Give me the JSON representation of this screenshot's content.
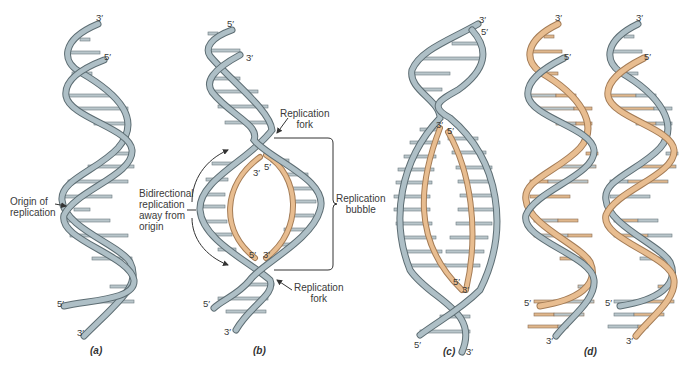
{
  "figure": {
    "colors": {
      "parent_strand_fill": "#aebfc6",
      "parent_strand_edge": "#5d6d73",
      "new_strand_fill": "#e8bd90",
      "new_strand_edge": "#a47c56",
      "base_pair": "#b7c3c8",
      "text": "#3a3a3a"
    },
    "panels": [
      {
        "id": "a",
        "label": "(a)",
        "ends": {
          "top_left": "3′",
          "top_right": "5′",
          "bottom_left": "5′",
          "bottom_right": "3′"
        },
        "annotations": {
          "origin": "Origin of\nreplication"
        }
      },
      {
        "id": "b",
        "label": "(b)",
        "ends": {
          "top_left": "5′",
          "top_right": "3′",
          "bottom_left": "5′",
          "bottom_right": "3′",
          "bubble_top_left": "3′",
          "bubble_top_right": "5′",
          "bubble_bottom_left": "5′",
          "bubble_bottom_right": "3′"
        },
        "annotations": {
          "fork_top": "Replication\nfork",
          "fork_bottom": "Replication\nfork",
          "bidirectional": "Bidirectional\nreplication\naway from\norigin",
          "bubble": "Replication\nbubble"
        }
      },
      {
        "id": "c",
        "label": "(c)",
        "ends": {
          "top_left": "3′",
          "top_right": "5′",
          "bottom_left": "5′",
          "bottom_right": "3′",
          "bubble_top_left": "3′",
          "bubble_top_right": "5′",
          "bubble_bottom_left": "5′",
          "bubble_bottom_right": "3′"
        }
      },
      {
        "id": "d",
        "label": "(d)",
        "ends": {
          "left_top": "3′",
          "left_mid": "5′",
          "left_bottom_5": "5′",
          "left_bottom_3": "3′",
          "right_top": "3′",
          "right_mid": "5′",
          "right_bottom_5": "5′",
          "right_bottom_3": "3′"
        }
      }
    ]
  }
}
